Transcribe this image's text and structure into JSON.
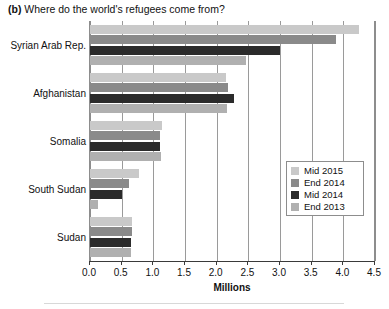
{
  "title": {
    "panel_label": "(b)",
    "text": "Where do the world's refugees come from?"
  },
  "axis": {
    "x_title": "Millions",
    "tick_labels": [
      "0.0",
      "0.5",
      "1.0",
      "1.5",
      "2.0",
      "2.5",
      "3.0",
      "3.5",
      "4.0",
      "4.5"
    ]
  },
  "legend": {
    "entries": [
      {
        "label": "Mid 2015",
        "color": "#c9c9c9"
      },
      {
        "label": "End 2014",
        "color": "#8a8a8a"
      },
      {
        "label": "Mid 2014",
        "color": "#2b2b2b"
      },
      {
        "label": "End 2013",
        "color": "#b0b0b0"
      }
    ]
  },
  "chart_data": {
    "type": "bar",
    "orientation": "horizontal",
    "title": "(b) Where do the world's refugees come from?",
    "xlabel": "Millions",
    "ylabel": "",
    "xlim": [
      0.0,
      4.5
    ],
    "grid": true,
    "legend_position": "inside-right",
    "categories": [
      "Syrian Arab Rep.",
      "Afghanistan",
      "Somalia",
      "South Sudan",
      "Sudan"
    ],
    "series": [
      {
        "name": "Mid 2015",
        "color": "#c9c9c9",
        "values": [
          4.25,
          2.15,
          1.13,
          0.78,
          0.66
        ]
      },
      {
        "name": "End 2014",
        "color": "#8a8a8a",
        "values": [
          3.88,
          2.18,
          1.11,
          0.62,
          0.67
        ]
      },
      {
        "name": "Mid 2014",
        "color": "#2b2b2b",
        "values": [
          3.0,
          2.27,
          1.11,
          0.5,
          0.65
        ]
      },
      {
        "name": "End 2013",
        "color": "#b0b0b0",
        "values": [
          2.47,
          2.16,
          1.12,
          0.13,
          0.65
        ]
      }
    ]
  }
}
